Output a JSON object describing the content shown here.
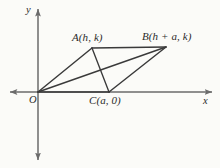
{
  "figure": {
    "kind": "geometry-diagram",
    "background_color": "#fbfbf8",
    "line_color": "#3a3a3a",
    "axis_color": "#6b6b6b",
    "text_color": "#2b2b2b"
  },
  "axes": {
    "x_axis": {
      "label": "x",
      "label_x": 203,
      "label_y": 96,
      "x1": 10,
      "y1": 92,
      "x2": 212,
      "y2": 92,
      "arrow_start": true,
      "arrow_end": true
    },
    "y_axis": {
      "label": "y",
      "label_x": 26,
      "label_y": 5,
      "x1": 38,
      "y1": 9,
      "x2": 38,
      "y2": 160,
      "arrow_start": true,
      "arrow_end": true
    },
    "origin": {
      "label": "O",
      "label_x": 29,
      "label_y": 95,
      "x": 38,
      "y": 92
    }
  },
  "points": [
    {
      "id": "A",
      "label": "A(h, k)",
      "x": 92,
      "y": 48,
      "label_x": 72,
      "label_y": 32
    },
    {
      "id": "B",
      "label": "B(h + a, k)",
      "x": 166,
      "y": 47,
      "label_x": 142,
      "label_y": 31
    },
    {
      "id": "C",
      "label": "C(a, 0)",
      "x": 109,
      "y": 92,
      "label_x": 89,
      "label_y": 95
    },
    {
      "id": "O",
      "label": "O",
      "x": 38,
      "y": 92,
      "label_x": 29,
      "label_y": 95
    }
  ],
  "segments": [
    {
      "name": "side-OA",
      "from": "O",
      "to": "A",
      "x1": 38,
      "y1": 92,
      "x2": 92,
      "y2": 48
    },
    {
      "name": "side-AB",
      "from": "A",
      "to": "B",
      "x1": 92,
      "y1": 48,
      "x2": 166,
      "y2": 47
    },
    {
      "name": "side-BC",
      "from": "B",
      "to": "C",
      "x1": 166,
      "y1": 47,
      "x2": 109,
      "y2": 92
    },
    {
      "name": "side-OC",
      "from": "O",
      "to": "C",
      "x1": 38,
      "y1": 92,
      "x2": 109,
      "y2": 92
    },
    {
      "name": "segment-AC",
      "from": "A",
      "to": "C",
      "x1": 92,
      "y1": 48,
      "x2": 109,
      "y2": 92
    },
    {
      "name": "diagonal-OB",
      "from": "O",
      "to": "B",
      "x1": 38,
      "y1": 92,
      "x2": 166,
      "y2": 47
    }
  ]
}
